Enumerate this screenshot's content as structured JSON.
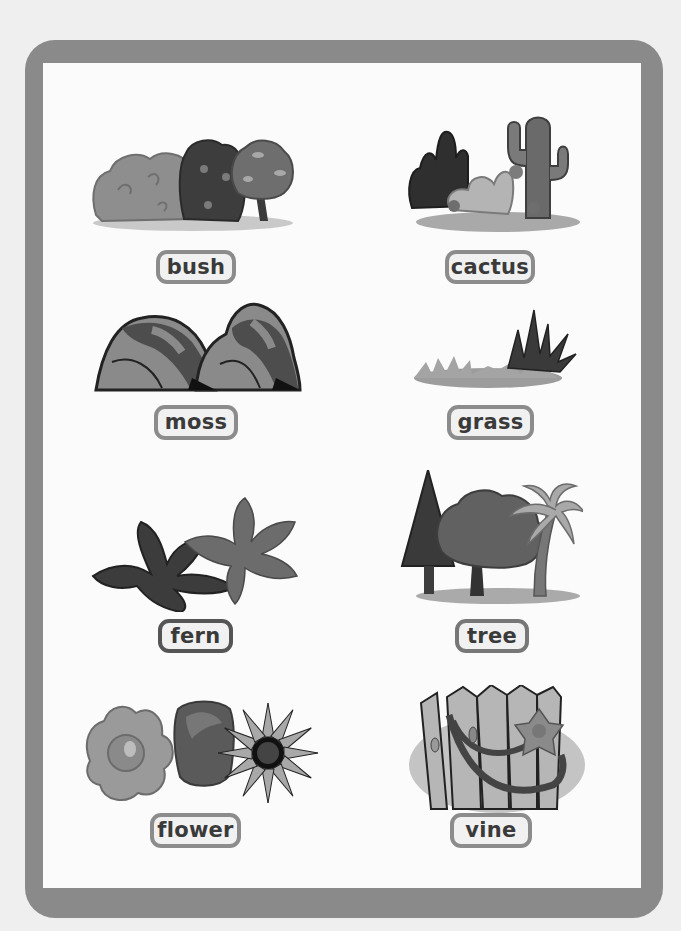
{
  "worksheet": {
    "cards": [
      {
        "id": "bush",
        "label": "bush",
        "icon": "bush-illustration"
      },
      {
        "id": "cactus",
        "label": "cactus",
        "icon": "cactus-illustration"
      },
      {
        "id": "moss",
        "label": "moss",
        "icon": "moss-rocks-illustration"
      },
      {
        "id": "grass",
        "label": "grass",
        "icon": "grass-illustration"
      },
      {
        "id": "fern",
        "label": "fern",
        "icon": "fern-illustration"
      },
      {
        "id": "tree",
        "label": "tree",
        "icon": "trees-illustration"
      },
      {
        "id": "flower",
        "label": "flower",
        "icon": "flowers-illustration"
      },
      {
        "id": "vine",
        "label": "vine",
        "icon": "vine-on-fence-illustration"
      }
    ]
  },
  "colors": {
    "frame": "#8a8a8a",
    "inner_background": "#fbfbfb",
    "label_border": "#8c8c8c",
    "label_fill": "#f1f1f1",
    "label_text": "#3a3a3a"
  }
}
